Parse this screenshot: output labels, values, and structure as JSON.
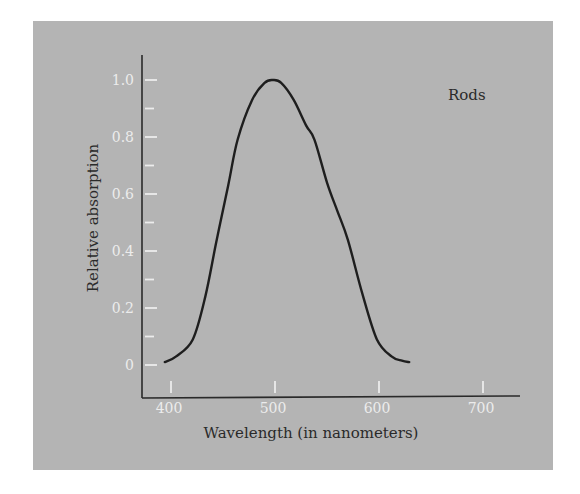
{
  "chart_data": {
    "type": "line",
    "title": "",
    "xlabel": "Wavelength (in nanometers)",
    "ylabel": "Relative absorption",
    "xlim": [
      380,
      730
    ],
    "ylim": [
      0,
      1.1
    ],
    "x_ticks": [
      400,
      500,
      600,
      700
    ],
    "x_tick_labels": [
      "400",
      "500",
      "600",
      "700"
    ],
    "y_ticks": [
      0,
      0.2,
      0.4,
      0.6,
      0.8,
      1.0
    ],
    "y_tick_labels": [
      "0",
      "0.2",
      "0.4",
      "0.6",
      "0.8",
      "1.0"
    ],
    "y_minor_ticks": [
      0.1,
      0.3,
      0.5,
      0.7,
      0.9
    ],
    "grid": false,
    "annotations": [
      {
        "text": "Rods",
        "x": 665,
        "y": 0.96
      }
    ],
    "series": [
      {
        "name": "Rods",
        "x": [
          394,
          405,
          421,
          433,
          444,
          455,
          464,
          478,
          490,
          498,
          506,
          518,
          530,
          538,
          550,
          560,
          570,
          584,
          598,
          612,
          622,
          629
        ],
        "values": [
          0.01,
          0.03,
          0.09,
          0.24,
          0.44,
          0.63,
          0.79,
          0.93,
          0.99,
          1.0,
          0.99,
          0.93,
          0.84,
          0.79,
          0.64,
          0.54,
          0.44,
          0.25,
          0.09,
          0.03,
          0.015,
          0.01
        ]
      }
    ]
  },
  "colors": {
    "panel": "#b4b4b4",
    "curve": "#1e1e1e",
    "ticks": "#ececec",
    "axis": "#2a2a2a"
  }
}
